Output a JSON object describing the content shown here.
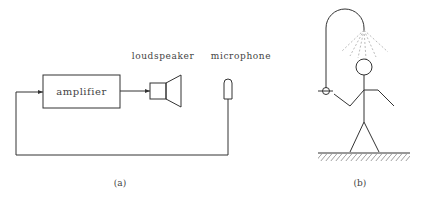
{
  "panel_a": {
    "amplifier_label": "amplifier",
    "loudspeaker_label": "loudspeaker",
    "microphone_label": "microphone",
    "caption": "(a)"
  },
  "panel_b": {
    "caption": "(b)"
  },
  "colors": {
    "stroke": "#333333",
    "spray": "#aaaaaa",
    "text": "#444444"
  }
}
